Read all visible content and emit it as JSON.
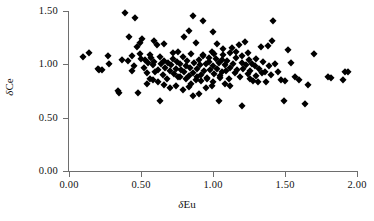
{
  "chart_data": {
    "type": "scatter",
    "title": "",
    "xlabel": "δEu",
    "ylabel": "δCe",
    "xlim": [
      0.0,
      2.0
    ],
    "ylim": [
      0.0,
      1.5
    ],
    "xticks": [
      "0.00",
      "0.50",
      "1.00",
      "1.50",
      "2.00"
    ],
    "xtick_values": [
      0.0,
      0.5,
      1.0,
      1.5,
      2.0
    ],
    "yticks": [
      "0.00",
      "0.50",
      "1.00",
      "1.50"
    ],
    "ytick_values": [
      0.0,
      0.5,
      1.0,
      1.5
    ],
    "grid": false,
    "legend": null,
    "marker": "filled-diamond",
    "marker_color": "#000000",
    "axis_color": "#6e6e6e",
    "series": [
      {
        "name": "samples",
        "points": [
          [
            0.1,
            1.07
          ],
          [
            0.14,
            1.11
          ],
          [
            0.2,
            0.96
          ],
          [
            0.21,
            0.95
          ],
          [
            0.23,
            0.95
          ],
          [
            0.27,
            1.08
          ],
          [
            0.28,
            1.0
          ],
          [
            0.34,
            0.75
          ],
          [
            0.35,
            0.73
          ],
          [
            0.37,
            1.04
          ],
          [
            0.39,
            1.48
          ],
          [
            0.41,
            1.03
          ],
          [
            0.42,
            1.26
          ],
          [
            0.44,
            0.94
          ],
          [
            0.45,
            0.98
          ],
          [
            0.46,
            1.43
          ],
          [
            0.47,
            1.16
          ],
          [
            0.48,
            0.73
          ],
          [
            0.49,
            1.2
          ],
          [
            0.5,
            1.05
          ],
          [
            0.51,
            1.24
          ],
          [
            0.52,
            0.97
          ],
          [
            0.53,
            1.04
          ],
          [
            0.54,
            0.92
          ],
          [
            0.55,
            1.01
          ],
          [
            0.56,
            0.86
          ],
          [
            0.57,
            1.06
          ],
          [
            0.58,
            0.99
          ],
          [
            0.59,
            1.02
          ],
          [
            0.6,
            0.93
          ],
          [
            0.61,
            1.18
          ],
          [
            0.62,
            0.95
          ],
          [
            0.63,
            0.66
          ],
          [
            0.64,
            1.0
          ],
          [
            0.65,
            0.9
          ],
          [
            0.66,
            1.03
          ],
          [
            0.67,
            0.97
          ],
          [
            0.68,
            0.86
          ],
          [
            0.69,
            1.01
          ],
          [
            0.7,
            0.94
          ],
          [
            0.71,
            0.99
          ],
          [
            0.72,
            1.05
          ],
          [
            0.73,
            0.91
          ],
          [
            0.74,
            0.96
          ],
          [
            0.75,
            1.02
          ],
          [
            0.76,
            0.88
          ],
          [
            0.77,
            1.0
          ],
          [
            0.78,
            0.95
          ],
          [
            0.79,
            1.07
          ],
          [
            0.8,
            0.93
          ],
          [
            0.81,
            0.98
          ],
          [
            0.82,
            1.03
          ],
          [
            0.83,
            0.89
          ],
          [
            0.84,
            0.97
          ],
          [
            0.85,
            1.1
          ],
          [
            0.86,
            0.92
          ],
          [
            0.87,
            1.01
          ],
          [
            0.88,
            0.85
          ],
          [
            0.89,
            0.96
          ],
          [
            0.9,
            1.04
          ],
          [
            0.91,
            0.99
          ],
          [
            0.92,
            0.9
          ],
          [
            0.93,
            1.08
          ],
          [
            0.94,
            0.94
          ],
          [
            0.95,
            1.0
          ],
          [
            0.96,
            0.87
          ],
          [
            0.97,
            1.02
          ],
          [
            0.98,
            0.95
          ],
          [
            0.99,
            1.12
          ],
          [
            1.0,
            0.98
          ],
          [
            1.01,
            0.91
          ],
          [
            1.02,
            1.05
          ],
          [
            1.03,
            0.96
          ],
          [
            1.04,
            1.01
          ],
          [
            1.05,
            0.89
          ],
          [
            1.06,
            0.93
          ],
          [
            1.07,
            1.09
          ],
          [
            1.08,
            0.99
          ],
          [
            1.09,
            0.94
          ],
          [
            1.1,
            1.03
          ],
          [
            1.11,
            0.86
          ],
          [
            1.12,
            0.97
          ],
          [
            1.13,
            1.15
          ],
          [
            1.14,
            1.0
          ],
          [
            1.15,
            0.92
          ],
          [
            1.16,
            1.06
          ],
          [
            1.17,
            0.95
          ],
          [
            1.18,
            1.18
          ],
          [
            1.19,
            0.88
          ],
          [
            1.2,
            1.01
          ],
          [
            1.21,
            0.96
          ],
          [
            1.22,
            1.21
          ],
          [
            1.23,
            0.99
          ],
          [
            1.24,
            0.91
          ],
          [
            1.25,
            1.04
          ],
          [
            1.26,
            0.94
          ],
          [
            1.27,
            1.0
          ],
          [
            1.28,
            0.84
          ],
          [
            1.29,
            0.98
          ],
          [
            1.3,
            1.05
          ],
          [
            1.31,
            0.83
          ],
          [
            1.32,
            0.96
          ],
          [
            1.33,
            1.16
          ],
          [
            1.35,
            1.02
          ],
          [
            1.36,
            0.93
          ],
          [
            1.38,
            1.17
          ],
          [
            1.39,
            0.98
          ],
          [
            1.4,
            0.9
          ],
          [
            1.41,
            1.22
          ],
          [
            1.42,
            1.41
          ],
          [
            1.43,
            1.0
          ],
          [
            1.45,
            0.93
          ],
          [
            1.47,
            0.85
          ],
          [
            1.49,
            0.66
          ],
          [
            1.5,
            0.84
          ],
          [
            1.52,
            1.13
          ],
          [
            1.54,
            1.01
          ],
          [
            1.57,
            0.88
          ],
          [
            1.6,
            0.85
          ],
          [
            1.64,
            0.63
          ],
          [
            1.66,
            0.81
          ],
          [
            1.7,
            1.1
          ],
          [
            1.8,
            0.88
          ],
          [
            1.82,
            0.87
          ],
          [
            1.9,
            0.85
          ],
          [
            1.92,
            0.93
          ],
          [
            1.94,
            0.93
          ],
          [
            0.86,
            1.45
          ],
          [
            0.93,
            1.41
          ],
          [
            0.83,
            1.31
          ],
          [
            0.8,
            1.26
          ],
          [
            1.0,
            1.3
          ],
          [
            1.03,
            1.19
          ],
          [
            1.07,
            1.14
          ],
          [
            0.88,
            1.2
          ],
          [
            0.72,
            1.11
          ],
          [
            0.76,
            1.12
          ],
          [
            0.66,
            1.19
          ],
          [
            0.59,
            1.22
          ],
          [
            1.12,
            1.11
          ],
          [
            1.16,
            1.12
          ],
          [
            1.2,
            1.08
          ],
          [
            1.24,
            1.11
          ],
          [
            0.7,
            0.78
          ],
          [
            0.74,
            0.8
          ],
          [
            0.79,
            0.76
          ],
          [
            0.83,
            0.79
          ],
          [
            0.86,
            0.7
          ],
          [
            0.9,
            0.72
          ],
          [
            0.95,
            0.78
          ],
          [
            0.99,
            0.8
          ],
          [
            1.04,
            0.66
          ],
          [
            1.2,
            0.61
          ],
          [
            1.08,
            0.82
          ],
          [
            1.12,
            0.8
          ],
          [
            0.54,
            0.82
          ],
          [
            0.58,
            0.85
          ],
          [
            0.62,
            0.83
          ],
          [
            0.66,
            0.81
          ],
          [
            0.92,
            0.84
          ],
          [
            0.96,
            0.86
          ],
          [
            1.0,
            0.83
          ],
          [
            1.05,
            0.87
          ],
          [
            0.77,
            0.88
          ],
          [
            0.81,
            0.86
          ],
          [
            0.85,
            0.82
          ],
          [
            0.89,
            0.88
          ],
          [
            1.26,
            0.86
          ],
          [
            1.3,
            0.89
          ],
          [
            1.34,
            0.92
          ],
          [
            1.37,
            0.83
          ],
          [
            0.44,
            1.08
          ],
          [
            0.49,
            1.1
          ],
          [
            0.56,
            1.09
          ],
          [
            0.63,
            1.07
          ],
          [
            0.93,
            1.09
          ],
          [
            0.97,
            1.06
          ],
          [
            1.01,
            1.1
          ],
          [
            1.06,
            1.04
          ]
        ]
      }
    ]
  }
}
